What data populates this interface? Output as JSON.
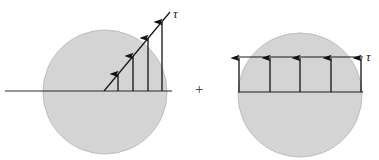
{
  "figure": {
    "title": "",
    "operator": "+",
    "colors": {
      "disk_fill": "#d4d4d4",
      "disk_stroke": "#bdbdbd",
      "line": "#1a1a1a",
      "arrow": "#111111",
      "background": "#ffffff",
      "axis": "#2a2a2a"
    },
    "left_panel": {
      "name": "inclined-traction-diagram",
      "tau_label": "τ",
      "disk": {
        "cx": 105,
        "cy": 92,
        "r": 62
      },
      "baseline": {
        "x1": 5,
        "y1": 91,
        "x2": 172,
        "y2": 91
      },
      "inclined_line": {
        "x1": 104,
        "y1": 91,
        "x2": 170,
        "y2": 12
      },
      "arrows": [
        {
          "x": 118,
          "y_base": 91,
          "y_tip": 74
        },
        {
          "x": 133,
          "y_base": 91,
          "y_tip": 56
        },
        {
          "x": 148,
          "y_base": 91,
          "y_tip": 38
        },
        {
          "x": 162,
          "y_base": 91,
          "y_tip": 22
        }
      ]
    },
    "right_panel": {
      "name": "uniform-traction-diagram",
      "tau_label": "τ",
      "disk": {
        "cx": 300,
        "cy": 95,
        "r": 62
      },
      "top_line": {
        "x1": 238,
        "y1": 57,
        "x2": 363,
        "y2": 57
      },
      "bottom_line": {
        "x1": 238,
        "y1": 92,
        "x2": 363,
        "y2": 92
      },
      "arrows": [
        {
          "x": 239,
          "y_base": 92,
          "y_tip": 58
        },
        {
          "x": 270,
          "y_base": 92,
          "y_tip": 58
        },
        {
          "x": 300,
          "y_base": 92,
          "y_tip": 58
        },
        {
          "x": 331,
          "y_base": 92,
          "y_tip": 58
        },
        {
          "x": 361,
          "y_base": 92,
          "y_tip": 58
        }
      ]
    }
  }
}
